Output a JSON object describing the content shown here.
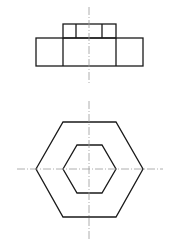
{
  "drawing": {
    "title": "Hexagonal nut orthographic views",
    "colors": {
      "outline": "#1a1a1a",
      "centerline": "#9a9a9a",
      "background": "#ffffff"
    },
    "front_view": {
      "base_rect": {
        "x": 36,
        "y": 38,
        "w": 107,
        "h": 28
      },
      "top_rect": {
        "x": 63,
        "y": 24,
        "w": 53,
        "h": 14
      },
      "top_inner_lines_x": [
        76,
        102
      ],
      "base_inner_lines_x": [
        63,
        116
      ],
      "centerline": {
        "x": 89,
        "y1": 7,
        "y2": 85
      }
    },
    "top_view": {
      "outer_hexagon": "36,169 63,122 116,122 143,169 116,217 63,217",
      "inner_hexagon": "63,169 77,145 102,145 116,169 102,193 77,193",
      "centerline_h": {
        "y": 169,
        "x1": 17,
        "x2": 163
      },
      "centerline_v": {
        "x": 89,
        "y1": 101,
        "y2": 239
      }
    }
  }
}
